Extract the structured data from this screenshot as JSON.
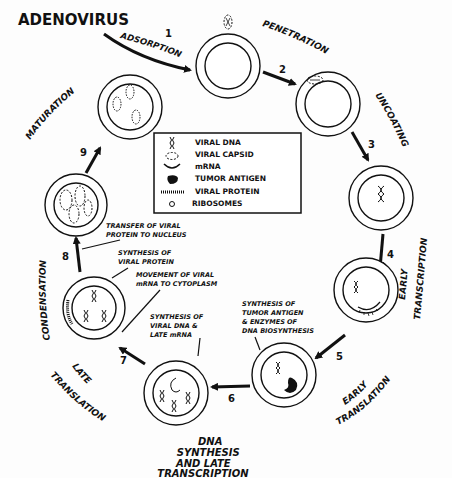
{
  "title": "ADENOVIRUS",
  "stages": [
    {
      "number": "1",
      "label": "ADSORPTION"
    },
    {
      "number": "2",
      "label": "PENETRATION"
    },
    {
      "number": "3",
      "label": "UNCOATING"
    },
    {
      "number": "4",
      "label_line1": "EARLY",
      "label_line2": "TRANSCRIPTION"
    },
    {
      "number": "5",
      "label_line1": "EARLY",
      "label_line2": "TRANSLATION"
    },
    {
      "number": "6",
      "label_line1": "DNA",
      "label_line2": "SYNTHESIS",
      "label_line3": "AND LATE",
      "label_line4": "TRANSCRIPTION"
    },
    {
      "number": "7",
      "label_line1": "LATE",
      "label_line2": "TRANSLATION"
    },
    {
      "number": "8",
      "label": "CONDENSATION"
    },
    {
      "number": "9",
      "label": "MATURATION"
    }
  ],
  "legend": {
    "items": [
      {
        "icon": "viral-dna-icon",
        "label": "VIRAL DNA"
      },
      {
        "icon": "viral-capsid-icon",
        "label": "VIRAL CAPSID"
      },
      {
        "icon": "mrna-icon",
        "label": "mRNA"
      },
      {
        "icon": "tumor-antigen-icon",
        "label": "TUMOR ANTIGEN"
      },
      {
        "icon": "viral-protein-icon",
        "label": "VIRAL PROTEIN"
      },
      {
        "icon": "ribosome-icon",
        "label": "RIBOSOMES"
      }
    ]
  },
  "annotations": {
    "transfer": {
      "line1": "TRANSFER OF VIRAL",
      "line2": "PROTEIN TO NUCLEUS"
    },
    "synth_protein": {
      "line1": "SYNTHESIS  OF",
      "line2": "VIRAL PROTEIN"
    },
    "movement": {
      "line1": "MOVEMENT OF VIRAL",
      "line2": "mRNA TO CYTOPLASM"
    },
    "synth_dna": {
      "line1": "SYNTHESIS OF",
      "line2": "VIRAL DNA &",
      "line3": "LATE mRNA"
    },
    "synth_tumor": {
      "line1": "SYNTHESIS OF",
      "line2": "TUMOR ANTIGEN",
      "line3": "& ENZYMES OF",
      "line4": "DNA BIOSYNTHESIS"
    }
  }
}
